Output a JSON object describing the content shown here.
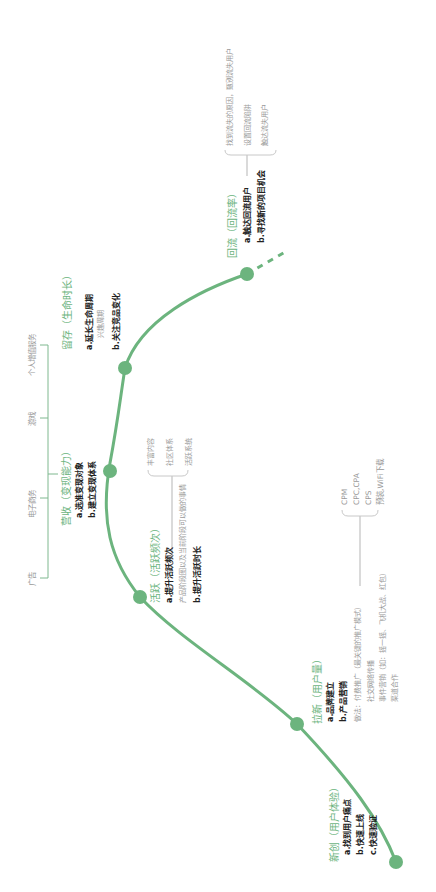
{
  "colors": {
    "curve": "#6cb47e",
    "node": "#6cb47e",
    "stage_title": "#6cb47e",
    "bold_text": "#222222",
    "light_text": "#9a9a9a",
    "bracket": "#b5b5b5"
  },
  "stages": {
    "xinchuang": {
      "title": "新创（用户体验）",
      "points": [
        "a.找到用户痛点",
        "b.快速上线",
        "c.快速验证"
      ]
    },
    "laxin": {
      "title": "拉新（用户量）",
      "points": [
        "a.品牌建立",
        "b.产品营销"
      ],
      "method": "做法：付费推广（最关键的推广模式）",
      "method_items": [
        "社交网络传播",
        "事件营销（如：摇一摇、飞机大战、红包）",
        "渠道合作"
      ],
      "paid_types": [
        "CPM",
        "CPC,CPA",
        "CPS",
        "预装,WiFi下载"
      ]
    },
    "huoyue": {
      "title": "活跃（活跃频次）",
      "points": [
        "a.提升活跃频次",
        "b.提升活跃时长"
      ],
      "note": "产品阶段图以及当前阶段可以做的事情",
      "methods": [
        "丰富内容",
        "社区体系",
        "活跃系统"
      ]
    },
    "yingshou": {
      "title": "营收（变现能力）",
      "points": [
        "a.选准变现对象",
        "b.建立变现体系"
      ],
      "channels": [
        "广告",
        "电子商务",
        "游戏",
        "个人增值服务"
      ]
    },
    "liucun": {
      "title": "留存（生命时长）",
      "points": [
        "a.延长生命周期",
        "b.关注竞品变化"
      ],
      "note": "兴趣周期"
    },
    "huiliu": {
      "title": "回流（回流率）",
      "points": [
        "a.触达回流用户",
        "b.寻找新的项目机会"
      ],
      "methods": [
        "找到流失的原因，甄别流失用户",
        "设置回流陷阱",
        "触达流失用户"
      ]
    }
  }
}
